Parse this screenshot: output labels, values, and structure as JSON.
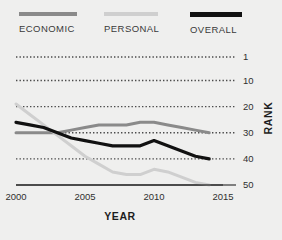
{
  "legend": {
    "items": [
      {
        "label": "ECONOMIC",
        "color": "#8a8a8a",
        "key": "economic"
      },
      {
        "label": "PERSONAL",
        "color": "#cfcfcf",
        "key": "personal"
      },
      {
        "label": "OVERALL",
        "color": "#111111",
        "key": "overall"
      }
    ]
  },
  "chart_data": {
    "type": "line",
    "title": "",
    "xlabel": "YEAR",
    "ylabel": "RANK",
    "x": [
      2000,
      2001,
      2002,
      2003,
      2004,
      2005,
      2006,
      2007,
      2008,
      2009,
      2010,
      2011,
      2012,
      2013,
      2014
    ],
    "xlim": [
      2000,
      2015
    ],
    "xticks": [
      2000,
      2005,
      2010,
      2015
    ],
    "xtick_labels": [
      "2000",
      "2005",
      "2010",
      "2015"
    ],
    "ylim": [
      1,
      50
    ],
    "y_inverted": true,
    "yticks": [
      1,
      10,
      20,
      30,
      40,
      50
    ],
    "ytick_labels": [
      "1",
      "10",
      "20",
      "30",
      "40",
      "50"
    ],
    "grid": true,
    "grid_style": "dotted",
    "legend_position": "top",
    "series": [
      {
        "name": "ECONOMIC",
        "color": "#8a8a8a",
        "width": 3,
        "values": [
          30,
          30,
          30,
          30,
          29,
          28,
          27,
          27,
          27,
          26,
          26,
          27,
          28,
          29,
          30
        ]
      },
      {
        "name": "PERSONAL",
        "color": "#cfcfcf",
        "width": 3,
        "values": [
          19,
          23,
          27,
          31,
          35,
          39,
          42,
          45,
          46,
          46,
          44,
          45,
          47,
          49,
          50
        ]
      },
      {
        "name": "OVERALL",
        "color": "#111111",
        "width": 3.2,
        "values": [
          26,
          27,
          28,
          30,
          32,
          33,
          34,
          35,
          35,
          35,
          33,
          35,
          37,
          39,
          40
        ]
      }
    ]
  }
}
